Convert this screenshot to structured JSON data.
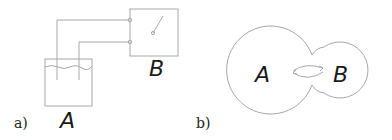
{
  "figure": {
    "panel_a": {
      "caption": "a)",
      "vessel_label": "A",
      "device_label": "B",
      "icons": [
        "liquid-vessel-icon",
        "switch-icon",
        "terminal-icon"
      ]
    },
    "panel_b": {
      "caption": "b)",
      "region_left_label": "A",
      "region_right_label": "B",
      "icons": [
        "exchange-arrows-icon"
      ]
    },
    "colors": {
      "line": "#a8a8a8",
      "text": "#1a1a1a",
      "background": "#ffffff"
    }
  }
}
